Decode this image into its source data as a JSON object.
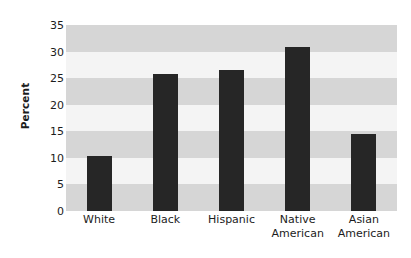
{
  "chart_data": {
    "type": "bar",
    "title": "",
    "xlabel": "",
    "ylabel": "Percent",
    "categories": [
      "White",
      "Black",
      "Hispanic",
      "Native American",
      "Asian American"
    ],
    "values": [
      10.3,
      25.8,
      26.5,
      30.8,
      14.5
    ],
    "ylim": [
      0,
      35
    ],
    "yticks": [
      0,
      5,
      10,
      15,
      20,
      25,
      30,
      35
    ],
    "ytick_labels": [
      "0",
      "5",
      "10",
      "15",
      "20",
      "25",
      "30",
      "35"
    ],
    "grid": false,
    "banded_background": true,
    "legend": null,
    "bar_color": "#262626",
    "band_color": "#d6d6d6",
    "band_alt_color": "#f4f4f4",
    "plot_background": "#ffffff"
  },
  "axis": {
    "y_title": "Percent"
  }
}
